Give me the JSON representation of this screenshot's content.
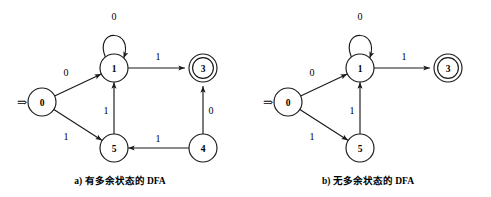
{
  "figure": {
    "background_color": "#ffffff",
    "stroke_color": "#1a1a1a",
    "panels": [
      {
        "id": "panel-a",
        "caption": "a) 有多余状态的 DFA",
        "caption_x": 120,
        "caption_y": 181,
        "start_marker": {
          "glyph": "⇒",
          "x": 22,
          "y": 102,
          "target": "0"
        },
        "nodes": [
          {
            "id": "0",
            "label": "0",
            "x": 42,
            "y": 102,
            "r": 14,
            "accepting": false
          },
          {
            "id": "1",
            "label": "1",
            "x": 114,
            "y": 68,
            "r": 14,
            "accepting": false
          },
          {
            "id": "3",
            "label": "3",
            "x": 203,
            "y": 68,
            "r": 14,
            "accepting": true
          },
          {
            "id": "5",
            "label": "5",
            "x": 114,
            "y": 148,
            "r": 14,
            "accepting": false
          },
          {
            "id": "4",
            "label": "4",
            "x": 203,
            "y": 148,
            "r": 14,
            "accepting": false
          }
        ],
        "edges": [
          {
            "from": "0",
            "to": "1",
            "label": "0",
            "label_x": 66,
            "label_y": 72,
            "type": "straight"
          },
          {
            "from": "0",
            "to": "5",
            "label": "1",
            "label_x": 66,
            "label_y": 136,
            "type": "straight"
          },
          {
            "from": "1",
            "to": "1",
            "label": "0",
            "label_x": 114,
            "label_y": 16,
            "type": "self-loop"
          },
          {
            "from": "1",
            "to": "3",
            "label": "1",
            "label_x": 158,
            "label_y": 56,
            "type": "straight"
          },
          {
            "from": "5",
            "to": "1",
            "label": "1",
            "label_x": 106,
            "label_y": 110,
            "type": "straight"
          },
          {
            "from": "4",
            "to": "5",
            "label": "1",
            "label_x": 158,
            "label_y": 138,
            "type": "straight"
          },
          {
            "from": "4",
            "to": "3",
            "label": "0",
            "label_x": 211,
            "label_y": 110,
            "type": "straight"
          }
        ]
      },
      {
        "id": "panel-b",
        "caption": "b) 无多余状态的 DFA",
        "caption_x": 368,
        "caption_y": 181,
        "start_marker": {
          "glyph": "⇒",
          "x": 268,
          "y": 102,
          "target": "0"
        },
        "nodes": [
          {
            "id": "0",
            "label": "0",
            "x": 288,
            "y": 102,
            "r": 14,
            "accepting": false
          },
          {
            "id": "1",
            "label": "1",
            "x": 360,
            "y": 68,
            "r": 14,
            "accepting": false
          },
          {
            "id": "3",
            "label": "3",
            "x": 448,
            "y": 68,
            "r": 14,
            "accepting": true
          },
          {
            "id": "5",
            "label": "5",
            "x": 360,
            "y": 148,
            "r": 14,
            "accepting": false
          }
        ],
        "edges": [
          {
            "from": "0",
            "to": "1",
            "label": "0",
            "label_x": 312,
            "label_y": 72,
            "type": "straight"
          },
          {
            "from": "0",
            "to": "5",
            "label": "1",
            "label_x": 312,
            "label_y": 136,
            "type": "straight"
          },
          {
            "from": "1",
            "to": "1",
            "label": "0",
            "label_x": 360,
            "label_y": 16,
            "type": "self-loop"
          },
          {
            "from": "1",
            "to": "3",
            "label": "1",
            "label_x": 404,
            "label_y": 56,
            "type": "straight"
          },
          {
            "from": "5",
            "to": "1",
            "label": "1",
            "label_x": 352,
            "label_y": 110,
            "type": "straight"
          }
        ]
      }
    ]
  }
}
